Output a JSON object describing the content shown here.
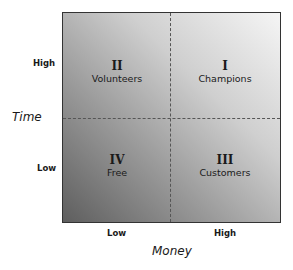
{
  "diagram": {
    "type": "2x2 quadrant matrix",
    "quadrants": [
      {
        "numeral": "II",
        "label": "Volunteers",
        "position": "top-left"
      },
      {
        "numeral": "I",
        "label": "Champions",
        "position": "top-right"
      },
      {
        "numeral": "IV",
        "label": "Free",
        "position": "bottom-left"
      },
      {
        "numeral": "III",
        "label": "Customers",
        "position": "bottom-right"
      }
    ],
    "y_axis": {
      "title": "Time",
      "ticks": {
        "high": "High",
        "low": "Low"
      }
    },
    "x_axis": {
      "title": "Money",
      "ticks": {
        "low": "Low",
        "high": "High"
      }
    },
    "colors": {
      "fill_dark": "#5e5e5e",
      "fill_light": "#f5f5f5",
      "border": "#333333",
      "divider": "#555555"
    }
  }
}
